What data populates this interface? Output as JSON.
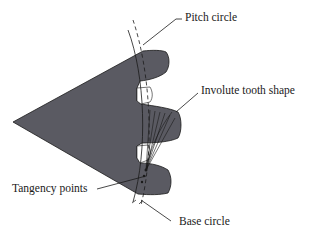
{
  "diagram": {
    "type": "gear-geometry",
    "labels": {
      "pitch_circle": "Pitch circle",
      "involute_tooth_shape": "Involute tooth shape",
      "tangency_points": "Tangency points",
      "base_circle": "Base circle"
    },
    "colors": {
      "gear_fill": "#5a5a62",
      "line": "#1a1a1a",
      "background": "#ffffff"
    }
  }
}
